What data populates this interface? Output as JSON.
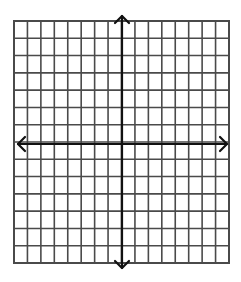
{
  "diagram": {
    "type": "coordinate-plane",
    "grid": {
      "columns": 16,
      "rows": 14,
      "left": 14,
      "top": 21,
      "right": 229,
      "bottom": 263,
      "line_color": "#4a4a4a",
      "line_width": 1.6
    },
    "axes": {
      "color": "#111111",
      "width": 2.2,
      "x_axis": {
        "y": 144,
        "x_start": 18,
        "x_end": 227,
        "arrows": [
          "left",
          "right"
        ]
      },
      "y_axis": {
        "x": 122,
        "y_start": 16,
        "y_end": 268,
        "arrows": [
          "up",
          "down"
        ]
      },
      "columns_left_of_y_axis": 8,
      "rows_above_x_axis": 7
    },
    "background": "#ffffff",
    "labels": []
  }
}
